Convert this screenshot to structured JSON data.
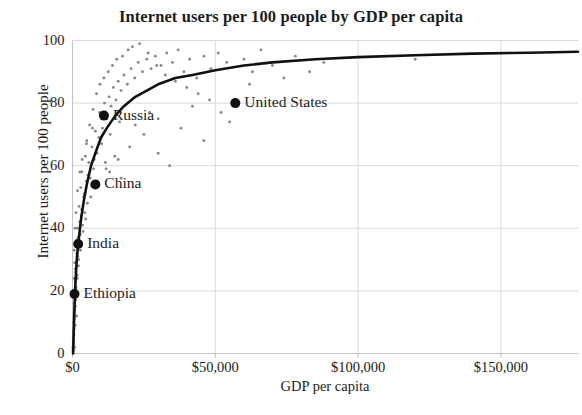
{
  "chart_data": {
    "type": "scatter",
    "title": "Internet users per 100 people by GDP per capita",
    "xlabel": "GDP per capita",
    "ylabel": "Internet users per 100 people",
    "xlim": [
      0,
      177000
    ],
    "ylim": [
      0,
      100
    ],
    "grid": true,
    "legend": false,
    "xticks": [
      0,
      50000,
      100000,
      150000
    ],
    "xtick_labels": [
      "$0",
      "$50,000",
      "$100,000",
      "$150,000"
    ],
    "yticks": [
      0,
      20,
      40,
      60,
      80,
      100
    ],
    "ytick_labels": [
      "0",
      "20",
      "40",
      "60",
      "80",
      "100"
    ],
    "marker_color": "#8a8a8a",
    "highlight_color": "#111111",
    "trendline_color": "#111111",
    "grid_color": "#d9d9d9",
    "annotations": [
      {
        "label": "United States",
        "x": 57000,
        "y": 80
      },
      {
        "label": "Russia",
        "x": 11000,
        "y": 76
      },
      {
        "label": "China",
        "x": 8000,
        "y": 54
      },
      {
        "label": "India",
        "x": 2000,
        "y": 35
      },
      {
        "label": "Ethiopia",
        "x": 700,
        "y": 19
      }
    ],
    "trendline": {
      "description": "logarithmic saturation fit",
      "points": [
        [
          200,
          0
        ],
        [
          400,
          6
        ],
        [
          700,
          15
        ],
        [
          1000,
          22
        ],
        [
          1500,
          30
        ],
        [
          2000,
          35
        ],
        [
          3000,
          43
        ],
        [
          4000,
          49
        ],
        [
          5000,
          54
        ],
        [
          6500,
          60
        ],
        [
          8000,
          64
        ],
        [
          10000,
          69
        ],
        [
          12000,
          72
        ],
        [
          15000,
          76
        ],
        [
          18000,
          79
        ],
        [
          22000,
          82
        ],
        [
          26000,
          84
        ],
        [
          30000,
          86
        ],
        [
          36000,
          88
        ],
        [
          42000,
          89
        ],
        [
          50000,
          90.5
        ],
        [
          60000,
          92
        ],
        [
          70000,
          93
        ],
        [
          85000,
          94
        ],
        [
          100000,
          94.7
        ],
        [
          120000,
          95.3
        ],
        [
          140000,
          95.8
        ],
        [
          160000,
          96.1
        ],
        [
          177000,
          96.4
        ]
      ]
    },
    "points": [
      [
        450,
        3
      ],
      [
        520,
        8
      ],
      [
        600,
        11
      ],
      [
        380,
        5
      ],
      [
        700,
        2
      ],
      [
        820,
        14
      ],
      [
        900,
        9
      ],
      [
        640,
        19
      ],
      [
        560,
        24
      ],
      [
        1100,
        17
      ],
      [
        1250,
        21
      ],
      [
        980,
        27
      ],
      [
        1400,
        12
      ],
      [
        760,
        29
      ],
      [
        1600,
        25
      ],
      [
        1850,
        31
      ],
      [
        1300,
        36
      ],
      [
        2100,
        28
      ],
      [
        2400,
        34
      ],
      [
        1750,
        40
      ],
      [
        2700,
        38
      ],
      [
        3100,
        44
      ],
      [
        2300,
        47
      ],
      [
        3500,
        41
      ],
      [
        3900,
        50
      ],
      [
        4300,
        45
      ],
      [
        2900,
        53
      ],
      [
        4800,
        55
      ],
      [
        5200,
        48
      ],
      [
        3300,
        58
      ],
      [
        5700,
        61
      ],
      [
        6200,
        56
      ],
      [
        4500,
        63
      ],
      [
        6800,
        66
      ],
      [
        7400,
        59
      ],
      [
        5000,
        68
      ],
      [
        8000,
        71
      ],
      [
        8600,
        64
      ],
      [
        6000,
        73
      ],
      [
        9200,
        69
      ],
      [
        9900,
        76
      ],
      [
        7200,
        78
      ],
      [
        10500,
        72
      ],
      [
        11200,
        80
      ],
      [
        8400,
        83
      ],
      [
        12000,
        75
      ],
      [
        12800,
        82
      ],
      [
        9600,
        86
      ],
      [
        13500,
        79
      ],
      [
        14300,
        85
      ],
      [
        11000,
        88
      ],
      [
        15200,
        81
      ],
      [
        16000,
        87
      ],
      [
        12500,
        90
      ],
      [
        17000,
        84
      ],
      [
        18000,
        89
      ],
      [
        14000,
        92
      ],
      [
        19200,
        86
      ],
      [
        20500,
        91
      ],
      [
        15500,
        94
      ],
      [
        21800,
        88
      ],
      [
        23000,
        93
      ],
      [
        17500,
        95
      ],
      [
        24500,
        90
      ],
      [
        26000,
        94
      ],
      [
        19500,
        97
      ],
      [
        27500,
        91
      ],
      [
        29000,
        95
      ],
      [
        21000,
        98
      ],
      [
        31000,
        92
      ],
      [
        33000,
        96
      ],
      [
        23500,
        99
      ],
      [
        35000,
        93
      ],
      [
        37000,
        97
      ],
      [
        26500,
        96
      ],
      [
        39000,
        90
      ],
      [
        41000,
        94
      ],
      [
        29500,
        92
      ],
      [
        43500,
        88
      ],
      [
        46000,
        95
      ],
      [
        32500,
        89
      ],
      [
        48500,
        91
      ],
      [
        51000,
        96
      ],
      [
        36000,
        87
      ],
      [
        54000,
        93
      ],
      [
        57000,
        80
      ],
      [
        60000,
        94
      ],
      [
        40000,
        85
      ],
      [
        63000,
        90
      ],
      [
        66000,
        97
      ],
      [
        44000,
        83
      ],
      [
        70000,
        92
      ],
      [
        74000,
        88
      ],
      [
        48000,
        81
      ],
      [
        78000,
        95
      ],
      [
        83000,
        90
      ],
      [
        52000,
        77
      ],
      [
        88000,
        93
      ],
      [
        120000,
        94
      ],
      [
        300,
        1
      ],
      [
        250,
        4
      ],
      [
        180,
        2
      ],
      [
        330,
        7
      ],
      [
        420,
        10
      ],
      [
        480,
        6
      ],
      [
        580,
        13
      ],
      [
        660,
        16
      ],
      [
        730,
        18
      ],
      [
        800,
        12
      ],
      [
        870,
        20
      ],
      [
        940,
        23
      ],
      [
        1020,
        15
      ],
      [
        1150,
        26
      ],
      [
        1350,
        19
      ],
      [
        1500,
        32
      ],
      [
        1700,
        24
      ],
      [
        1950,
        37
      ],
      [
        2200,
        30
      ],
      [
        2500,
        42
      ],
      [
        2800,
        33
      ],
      [
        3200,
        46
      ],
      [
        3700,
        39
      ],
      [
        4100,
        51
      ],
      [
        4600,
        43
      ],
      [
        5400,
        57
      ],
      [
        6400,
        50
      ],
      [
        7600,
        62
      ],
      [
        8800,
        55
      ],
      [
        10200,
        67
      ],
      [
        11800,
        59
      ],
      [
        13200,
        70
      ],
      [
        14800,
        63
      ],
      [
        16500,
        74
      ],
      [
        600,
        33
      ],
      [
        900,
        40
      ],
      [
        1200,
        45
      ],
      [
        1800,
        52
      ],
      [
        2600,
        58
      ],
      [
        3400,
        62
      ],
      [
        4900,
        67
      ],
      [
        7000,
        72
      ],
      [
        9500,
        77
      ],
      [
        13000,
        58
      ],
      [
        16000,
        62
      ],
      [
        20000,
        66
      ],
      [
        25000,
        70
      ],
      [
        30000,
        75
      ],
      [
        38000,
        72
      ],
      [
        46000,
        68
      ],
      [
        55000,
        74
      ],
      [
        62000,
        86
      ],
      [
        30000,
        64
      ],
      [
        34000,
        60
      ],
      [
        27000,
        77
      ],
      [
        42000,
        79
      ],
      [
        17000,
        56
      ],
      [
        11500,
        61
      ],
      [
        22000,
        73
      ]
    ]
  }
}
